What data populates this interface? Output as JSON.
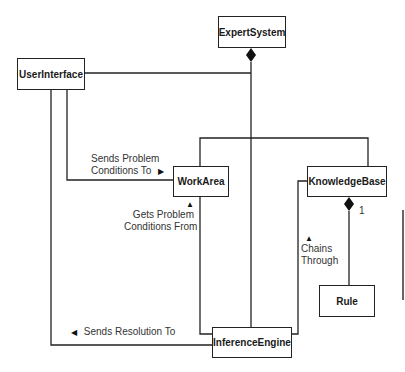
{
  "diagram": {
    "type": "UML class diagram",
    "classes": {
      "expert_system": "ExpertSystem",
      "user_interface": "UserInterface",
      "work_area": "WorkArea",
      "knowledge_base": "KnowledgeBase",
      "inference_engine": "InferenceEngine",
      "rule": "Rule"
    },
    "associations": {
      "sends_problem": {
        "line1": "Sends Problem",
        "line2": "Conditions To",
        "arrow": "▶"
      },
      "gets_problem": {
        "arrow": "▲",
        "line1": "Gets Problem",
        "line2": "Conditions From"
      },
      "chains_through": {
        "arrow": "▲",
        "line1": "Chains",
        "line2": "Through"
      },
      "sends_resolution": {
        "arrow": "◀",
        "text": "Sends Resolution To"
      }
    },
    "multiplicity": {
      "kb_rule": "1"
    },
    "colors": {
      "line": "#222222",
      "text": "#333333",
      "background": "#ffffff"
    }
  }
}
